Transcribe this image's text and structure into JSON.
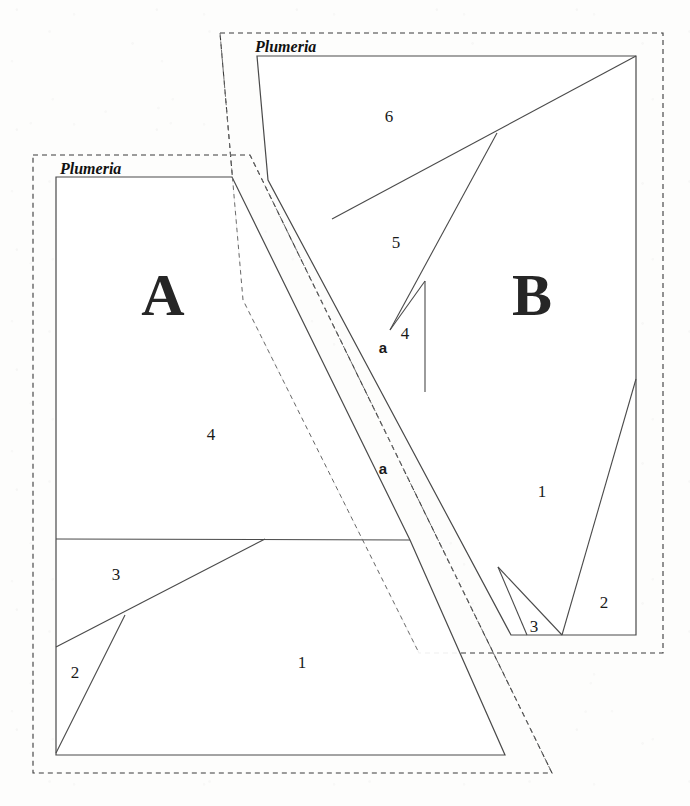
{
  "page": {
    "background_color": "#fdfdfc",
    "line_color": "#4a4a4a",
    "text_color": "#1a1a1a",
    "width": 690,
    "height": 806
  },
  "blocks": [
    {
      "id": "block-a",
      "letter": "A",
      "brand_label": "Plumeria",
      "pieces": [
        {
          "label": "1"
        },
        {
          "label": "2"
        },
        {
          "label": "3"
        },
        {
          "label": "4"
        }
      ]
    },
    {
      "id": "block-b",
      "letter": "B",
      "brand_label": "Plumeria",
      "pieces": [
        {
          "label": "1"
        },
        {
          "label": "2"
        },
        {
          "label": "3"
        },
        {
          "label": "4"
        },
        {
          "label": "5"
        },
        {
          "label": "6"
        }
      ]
    }
  ],
  "sub_labels": [
    {
      "label": "a"
    },
    {
      "label": "a"
    }
  ],
  "labels": {
    "block_a_letter": "A",
    "block_b_letter": "B",
    "brand_a": "Plumeria",
    "brand_b": "Plumeria",
    "a_piece_1": "1",
    "a_piece_2": "2",
    "a_piece_3": "3",
    "a_piece_4": "4",
    "b_piece_1": "1",
    "b_piece_2": "2",
    "b_piece_3": "3",
    "b_piece_4": "4",
    "b_piece_5": "5",
    "b_piece_6": "6",
    "sub_a_upper": "a",
    "sub_a_lower": "a"
  }
}
